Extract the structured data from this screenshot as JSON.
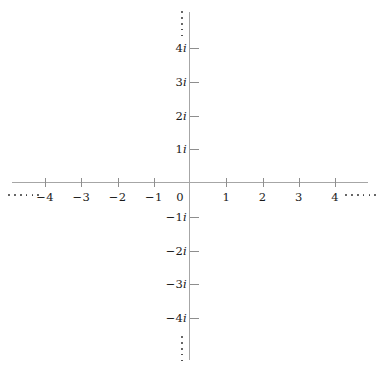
{
  "chart_data": {
    "type": "scatter",
    "title": "",
    "subtitle": "",
    "xlabel": "",
    "ylabel": "",
    "grid": false,
    "legend": null,
    "xlim": [
      -4.9,
      4.9
    ],
    "ylim": [
      -4.9,
      4.9
    ],
    "x_ticks": [
      -4,
      -3,
      -2,
      -1,
      0,
      1,
      2,
      3,
      4
    ],
    "x_tick_labels": [
      "−4",
      "−3",
      "−2",
      "−1",
      "0",
      "1",
      "2",
      "3",
      "4"
    ],
    "y_ticks": [
      -4,
      -3,
      -2,
      -1,
      1,
      2,
      3,
      4
    ],
    "y_tick_labels": [
      "−4i",
      "−3i",
      "−2i",
      "−1i",
      "1i",
      "2i",
      "3i",
      "4i"
    ],
    "series": [],
    "values": [],
    "continuation_marks": [
      "left",
      "right",
      "top",
      "bottom"
    ]
  },
  "plane": {
    "origin_label": "0",
    "axis_color": "#a6a6a6",
    "tick_color": "#8e8e8e",
    "label_color": "#1a1a1a",
    "x_labels": [
      {
        "value": -4,
        "text": "−4"
      },
      {
        "value": -3,
        "text": "−3"
      },
      {
        "value": -2,
        "text": "−2"
      },
      {
        "value": -1,
        "text": "−1"
      },
      {
        "value": 1,
        "text": "1"
      },
      {
        "value": 2,
        "text": "2"
      },
      {
        "value": 3,
        "text": "3"
      },
      {
        "value": 4,
        "text": "4"
      }
    ],
    "y_labels": [
      {
        "value": 4,
        "num": "4",
        "unit": "i"
      },
      {
        "value": 3,
        "num": "3",
        "unit": "i"
      },
      {
        "value": 2,
        "num": "2",
        "unit": "i"
      },
      {
        "value": 1,
        "num": "1",
        "unit": "i"
      },
      {
        "value": -1,
        "num": "−1",
        "unit": "i"
      },
      {
        "value": -2,
        "num": "−2",
        "unit": "i"
      },
      {
        "value": -3,
        "num": "−3",
        "unit": "i"
      },
      {
        "value": -4,
        "num": "−4",
        "unit": "i"
      }
    ]
  }
}
